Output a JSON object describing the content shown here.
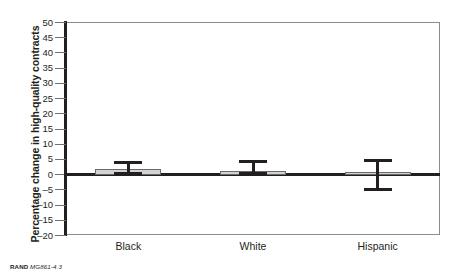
{
  "chart_data": {
    "type": "bar",
    "title": "",
    "xlabel": "",
    "ylabel": "Percentage change in high-quality contracts",
    "categories": [
      "Black",
      "White",
      "Hispanic"
    ],
    "values": [
      1.8,
      1.2,
      1.0
    ],
    "series": [
      {
        "name": "Percentage change in high-quality contracts",
        "values": [
          1.8,
          1.2,
          1.0
        ],
        "error_low": [
          0.0,
          0.0,
          -5.5
        ],
        "error_high": [
          4.5,
          4.7,
          5.0
        ]
      }
    ],
    "ylim": [
      -20,
      50
    ],
    "ytick_labels": [
      "50",
      "45",
      "40",
      "35",
      "30",
      "25",
      "20",
      "15",
      "10",
      "5",
      "0",
      "–5",
      "–10",
      "–15",
      "–20"
    ],
    "ytick_values": [
      50,
      45,
      40,
      35,
      30,
      25,
      20,
      15,
      10,
      5,
      0,
      -5,
      -10,
      -15,
      -20
    ],
    "grid": false,
    "legend": "none",
    "bar_fill_color": "#d2d2d2",
    "bar_edge_color": "#6a6a6a",
    "axis_color": "#231f20",
    "error_bar_color": "#231f20"
  },
  "credit": {
    "organization": "RAND",
    "figure_number": "MG861-4.3"
  }
}
